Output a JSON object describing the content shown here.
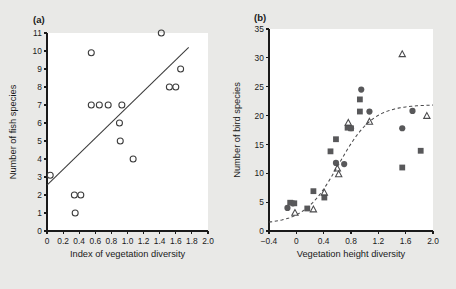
{
  "figure": {
    "background_color": "#e9e9e7",
    "plot_background_color": "#ffffff",
    "marker_color": "#58585a",
    "axis_color": "#1a1a1a"
  },
  "chart_data": [
    {
      "id": "panel-a",
      "type": "scatter",
      "panel_label": "(a)",
      "title": "",
      "xlabel": "Index of vegetation diversity",
      "ylabel": "Number of fish species",
      "xlim": [
        0,
        2.0
      ],
      "ylim": [
        0,
        11
      ],
      "xticks": [
        0,
        0.2,
        0.4,
        0.6,
        0.8,
        1.0,
        1.2,
        1.4,
        1.6,
        1.8,
        2.0
      ],
      "xticklabels": [
        "0",
        "0.2",
        "0.4",
        "0.6",
        "0.8",
        "1.0",
        "1.2",
        "1.4",
        "1.6",
        "1.8",
        "2.0"
      ],
      "yticks": [
        0,
        1,
        2,
        3,
        4,
        5,
        6,
        7,
        8,
        9,
        10,
        11
      ],
      "yticklabels": [
        "0",
        "1",
        "2",
        "3",
        "4",
        "5",
        "6",
        "7",
        "8",
        "9",
        "10",
        "11"
      ],
      "grid": false,
      "legend": "none",
      "series": [
        {
          "name": "Lakes",
          "marker": "open-circle",
          "points": [
            [
              0.04,
              3.1
            ],
            [
              0.34,
              2.0
            ],
            [
              0.35,
              1.0
            ],
            [
              0.42,
              2.0
            ],
            [
              0.55,
              9.9
            ],
            [
              0.55,
              7.0
            ],
            [
              0.65,
              7.0
            ],
            [
              0.76,
              7.0
            ],
            [
              0.9,
              6.0
            ],
            [
              0.91,
              5.0
            ],
            [
              0.93,
              7.0
            ],
            [
              1.07,
              4.0
            ],
            [
              1.42,
              11.0
            ],
            [
              1.52,
              8.0
            ],
            [
              1.6,
              8.0
            ],
            [
              1.66,
              9.0
            ]
          ]
        }
      ],
      "fit": {
        "kind": "straight-line",
        "x_start": 0.0,
        "y_start": 2.55,
        "x_end": 1.76,
        "y_end": 10.2
      }
    },
    {
      "id": "panel-b",
      "type": "scatter",
      "panel_label": "(b)",
      "title": "",
      "xlabel": "Vegetation height diversity",
      "ylabel": "Number of bird species",
      "xlim": [
        -0.4,
        2.0
      ],
      "ylim": [
        0,
        35
      ],
      "xticks": [
        -0.4,
        0,
        0.4,
        0.8,
        1.2,
        1.6,
        2.0
      ],
      "xticklabels": [
        "−0.4",
        "0",
        "0.4",
        "0.8",
        "1.2",
        "1.6",
        "2.0"
      ],
      "yticks": [
        0,
        5,
        10,
        15,
        20,
        25,
        30,
        35
      ],
      "yticklabels": [
        "0",
        "5",
        "10",
        "15",
        "20",
        "25",
        "30",
        "35"
      ],
      "grid": false,
      "legend": "none",
      "series": [
        {
          "name": "Group 1",
          "marker": "filled-circle",
          "points": [
            [
              -0.13,
              4.0
            ],
            [
              -0.05,
              4.8
            ],
            [
              0.58,
              11.8
            ],
            [
              0.7,
              11.6
            ],
            [
              0.8,
              17.8
            ],
            [
              0.95,
              24.5
            ],
            [
              1.07,
              20.7
            ],
            [
              1.55,
              17.8
            ],
            [
              1.7,
              20.8
            ]
          ]
        },
        {
          "name": "Group 2",
          "marker": "filled-square",
          "points": [
            [
              -0.09,
              4.9
            ],
            [
              -0.03,
              4.8
            ],
            [
              0.16,
              3.9
            ],
            [
              0.25,
              6.9
            ],
            [
              0.41,
              5.8
            ],
            [
              0.5,
              13.8
            ],
            [
              0.58,
              15.9
            ],
            [
              0.75,
              17.9
            ],
            [
              0.8,
              17.8
            ],
            [
              0.93,
              22.8
            ],
            [
              0.93,
              20.7
            ],
            [
              1.55,
              11.0
            ],
            [
              1.82,
              13.9
            ]
          ]
        },
        {
          "name": "Group 3",
          "marker": "open-triangle",
          "points": [
            [
              -0.02,
              3.1
            ],
            [
              0.25,
              3.7
            ],
            [
              0.41,
              6.6
            ],
            [
              0.6,
              10.8
            ],
            [
              0.62,
              9.8
            ],
            [
              0.76,
              18.7
            ],
            [
              1.07,
              18.9
            ],
            [
              1.55,
              30.6
            ],
            [
              1.91,
              19.9
            ]
          ]
        }
      ],
      "fit": {
        "kind": "dashed-sigmoid-curve",
        "x_start": -0.4,
        "y_start": 1.2,
        "x_end": 2.0,
        "y_end": 21.8,
        "midpoint_x": 0.62,
        "asymptote_y": 21.9
      }
    }
  ]
}
